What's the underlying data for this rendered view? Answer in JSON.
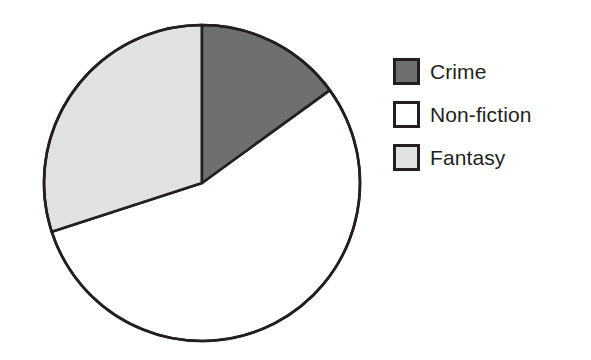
{
  "chart_data": {
    "type": "pie",
    "title": "",
    "subtitle": "",
    "xlabel": "",
    "ylabel": "",
    "grid": false,
    "legend_position": "right",
    "start_angle_deg": 0,
    "direction": "clockwise",
    "categories": [
      "Crime",
      "Non-fiction",
      "Fantasy"
    ],
    "values": [
      15,
      55,
      30
    ],
    "value_unit": "percent",
    "angles_deg": [
      54,
      198,
      108
    ],
    "slices": [
      {
        "label": "Crime",
        "value": 15,
        "angle_deg": 54,
        "start_deg": 0,
        "end_deg": 54,
        "fill": "#6f6f6f",
        "stroke": "#231f20"
      },
      {
        "label": "Non-fiction",
        "value": 55,
        "angle_deg": 198,
        "start_deg": 54,
        "end_deg": 252,
        "fill": "#ffffff",
        "stroke": "#231f20"
      },
      {
        "label": "Fantasy",
        "value": 30,
        "angle_deg": 108,
        "start_deg": 252,
        "end_deg": 360,
        "fill": "#e2e2e2",
        "stroke": "#231f20"
      }
    ],
    "annotations": []
  },
  "legend": {
    "items": [
      {
        "label": "Crime",
        "swatch_color": "#6f6f6f"
      },
      {
        "label": "Non-fiction",
        "swatch_color": "#ffffff"
      },
      {
        "label": "Fantasy",
        "swatch_color": "#e2e2e2"
      }
    ]
  },
  "colors": {
    "outline": "#231f20",
    "background": "#ffffff",
    "crime": "#6f6f6f",
    "non_fiction": "#ffffff",
    "fantasy": "#e2e2e2"
  },
  "geometry": {
    "center_x": 202,
    "center_y": 183,
    "radius": 158
  }
}
